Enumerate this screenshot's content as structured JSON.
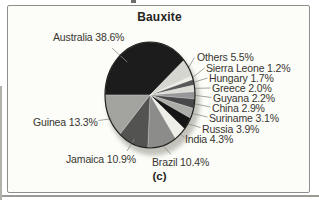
{
  "figure": {
    "panel_label": "(c)"
  },
  "chart_data": {
    "type": "pie",
    "title": "Bauxite",
    "unit": "%",
    "start_angle_deg": 180,
    "direction": "clockwise",
    "legend_position": "around-slices",
    "slices": [
      {
        "label": "Australia",
        "value": 38.6,
        "display": "Australia 38.6%",
        "color": "#1c1c1c"
      },
      {
        "label": "Others",
        "value": 5.5,
        "display": "Others 5.5%",
        "color": "#d6d6d1"
      },
      {
        "label": "Sierra Leone",
        "value": 1.2,
        "display": "Sierra Leone 1.2%",
        "color": "#eeeee9"
      },
      {
        "label": "Hungary",
        "value": 1.7,
        "display": "Hungary 1.7%",
        "color": "#58585a"
      },
      {
        "label": "Greece",
        "value": 2.0,
        "display": "Greece 2.0%",
        "color": "#dcdcd7"
      },
      {
        "label": "Guyana",
        "value": 2.2,
        "display": "Guyana 2.2%",
        "color": "#97979a"
      },
      {
        "label": "China",
        "value": 2.9,
        "display": "China 2.9%",
        "color": "#48484a"
      },
      {
        "label": "Suriname",
        "value": 3.1,
        "display": "Suriname 3.1%",
        "color": "#acaca8"
      },
      {
        "label": "Russia",
        "value": 3.9,
        "display": "Russia 3.9%",
        "color": "#161616"
      },
      {
        "label": "India",
        "value": 4.3,
        "display": "India 4.3%",
        "color": "#efefea"
      },
      {
        "label": "Brazil",
        "value": 10.4,
        "display": "Brazil 10.4%",
        "color": "#8c8c8a"
      },
      {
        "label": "Jamaica",
        "value": 10.9,
        "display": "Jamaica 10.9%",
        "color": "#535351"
      },
      {
        "label": "Guinea",
        "value": 13.3,
        "display": "Guinea 13.3%",
        "color": "#a3a3a0"
      }
    ]
  }
}
